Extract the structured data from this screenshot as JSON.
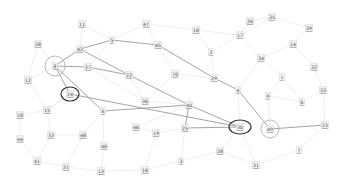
{
  "diagram": {
    "type": "network-graph",
    "nodes": [
      {
        "id": "11",
        "x": 82,
        "y": 24
      },
      {
        "id": "47",
        "x": 146,
        "y": 24
      },
      {
        "id": "18",
        "x": 196,
        "y": 30
      },
      {
        "id": "26",
        "x": 250,
        "y": 21
      },
      {
        "id": "35",
        "x": 272,
        "y": 17
      },
      {
        "id": "17",
        "x": 240,
        "y": 35
      },
      {
        "id": "39",
        "x": 309,
        "y": 28
      },
      {
        "id": "38",
        "x": 38,
        "y": 44
      },
      {
        "id": "5",
        "x": 112,
        "y": 40
      },
      {
        "id": "45",
        "x": 158,
        "y": 45
      },
      {
        "id": "42",
        "x": 80,
        "y": 49
      },
      {
        "id": "2",
        "x": 211,
        "y": 52
      },
      {
        "id": "14",
        "x": 293,
        "y": 44
      },
      {
        "id": "34",
        "x": 261,
        "y": 58
      },
      {
        "id": "8",
        "x": 55,
        "y": 66
      },
      {
        "id": "27",
        "x": 88,
        "y": 67
      },
      {
        "id": "22",
        "x": 129,
        "y": 75
      },
      {
        "id": "70",
        "x": 175,
        "y": 74
      },
      {
        "id": "29",
        "x": 214,
        "y": 78
      },
      {
        "id": "12",
        "x": 28,
        "y": 80
      },
      {
        "id": "32",
        "x": 314,
        "y": 67
      },
      {
        "id": "1",
        "x": 282,
        "y": 77
      },
      {
        "id": "24",
        "x": 70,
        "y": 94
      },
      {
        "id": "4",
        "x": 238,
        "y": 90
      },
      {
        "id": "33",
        "x": 323,
        "y": 90
      },
      {
        "id": "36",
        "x": 145,
        "y": 101
      },
      {
        "id": "9",
        "x": 268,
        "y": 96
      },
      {
        "id": "6",
        "x": 302,
        "y": 102
      },
      {
        "id": "15",
        "x": 47,
        "y": 110
      },
      {
        "id": "18b",
        "label": "18",
        "x": 20,
        "y": 115
      },
      {
        "id": "6b",
        "label": "6",
        "x": 103,
        "y": 111
      },
      {
        "id": "40",
        "x": 189,
        "y": 105
      },
      {
        "id": "46",
        "x": 136,
        "y": 127
      },
      {
        "id": "30",
        "x": 240,
        "y": 127
      },
      {
        "id": "49",
        "x": 270,
        "y": 129
      },
      {
        "id": "23",
        "x": 325,
        "y": 125
      },
      {
        "id": "19",
        "x": 156,
        "y": 133
      },
      {
        "id": "25",
        "x": 185,
        "y": 128
      },
      {
        "id": "32b",
        "label": "32",
        "x": 51,
        "y": 135
      },
      {
        "id": "48",
        "x": 83,
        "y": 135
      },
      {
        "id": "44",
        "x": 20,
        "y": 139
      },
      {
        "id": "46b",
        "label": "46",
        "x": 104,
        "y": 146
      },
      {
        "id": "7",
        "x": 299,
        "y": 150
      },
      {
        "id": "28",
        "x": 220,
        "y": 151
      },
      {
        "id": "41",
        "x": 37,
        "y": 161
      },
      {
        "id": "3",
        "x": 181,
        "y": 161
      },
      {
        "id": "21",
        "x": 66,
        "y": 167
      },
      {
        "id": "16",
        "x": 145,
        "y": 170
      },
      {
        "id": "31",
        "x": 256,
        "y": 165
      },
      {
        "id": "13",
        "x": 101,
        "y": 171
      }
    ],
    "highlights": [
      {
        "node": "8",
        "style": "light",
        "rx": 10,
        "ry": 10
      },
      {
        "node": "24",
        "style": "dark",
        "rx": 9,
        "ry": 7
      },
      {
        "node": "30",
        "style": "dark",
        "rx": 11,
        "ry": 7
      },
      {
        "node": "49",
        "style": "light",
        "rx": 9,
        "ry": 9
      }
    ],
    "strong_edges": [
      [
        "8",
        "42"
      ],
      [
        "42",
        "5"
      ],
      [
        "5",
        "45"
      ],
      [
        "45",
        "29"
      ],
      [
        "29",
        "4"
      ],
      [
        "8",
        "27"
      ],
      [
        "27",
        "22"
      ],
      [
        "42",
        "22"
      ],
      [
        "22",
        "40"
      ],
      [
        "40",
        "30"
      ],
      [
        "8",
        "24"
      ],
      [
        "24",
        "30"
      ],
      [
        "8",
        "6b"
      ],
      [
        "6b",
        "40"
      ],
      [
        "40",
        "25"
      ],
      [
        "25",
        "30"
      ],
      [
        "4",
        "49"
      ],
      [
        "49",
        "23"
      ]
    ],
    "faint_edges": [
      [
        "38",
        "8"
      ],
      [
        "11",
        "42"
      ],
      [
        "11",
        "5"
      ],
      [
        "47",
        "5"
      ],
      [
        "47",
        "45"
      ],
      [
        "47",
        "18"
      ],
      [
        "18",
        "17"
      ],
      [
        "26",
        "17"
      ],
      [
        "35",
        "17"
      ],
      [
        "35",
        "39"
      ],
      [
        "39",
        "14"
      ],
      [
        "14",
        "34"
      ],
      [
        "17",
        "34"
      ],
      [
        "17",
        "2"
      ],
      [
        "2",
        "29"
      ],
      [
        "34",
        "1"
      ],
      [
        "14",
        "32"
      ],
      [
        "32",
        "33"
      ],
      [
        "1",
        "9"
      ],
      [
        "1",
        "6"
      ],
      [
        "6",
        "33"
      ],
      [
        "9",
        "49"
      ],
      [
        "12",
        "8"
      ],
      [
        "12",
        "15"
      ],
      [
        "15",
        "18b"
      ],
      [
        "15",
        "32b"
      ],
      [
        "18b",
        "44"
      ],
      [
        "44",
        "41"
      ],
      [
        "32b",
        "41"
      ],
      [
        "41",
        "21"
      ],
      [
        "21",
        "13"
      ],
      [
        "48",
        "21"
      ],
      [
        "48",
        "6b"
      ],
      [
        "46b",
        "13"
      ],
      [
        "46b",
        "6b"
      ],
      [
        "13",
        "16"
      ],
      [
        "16",
        "19"
      ],
      [
        "19",
        "46"
      ],
      [
        "46",
        "40"
      ],
      [
        "36",
        "22"
      ],
      [
        "36",
        "40"
      ],
      [
        "70",
        "45"
      ],
      [
        "70",
        "29"
      ],
      [
        "25",
        "3"
      ],
      [
        "3",
        "28"
      ],
      [
        "28",
        "31"
      ],
      [
        "31",
        "30"
      ],
      [
        "31",
        "7"
      ],
      [
        "7",
        "23"
      ],
      [
        "28",
        "30"
      ],
      [
        "4",
        "30"
      ],
      [
        "34",
        "4"
      ],
      [
        "18",
        "2"
      ],
      [
        "26",
        "35"
      ],
      [
        "12",
        "38"
      ],
      [
        "15",
        "24"
      ],
      [
        "48",
        "32b"
      ],
      [
        "16",
        "3"
      ],
      [
        "19",
        "25"
      ],
      [
        "9",
        "6"
      ],
      [
        "33",
        "23"
      ],
      [
        "70",
        "36"
      ],
      [
        "24",
        "15"
      ],
      [
        "27",
        "36"
      ],
      [
        "5",
        "27"
      ]
    ]
  }
}
